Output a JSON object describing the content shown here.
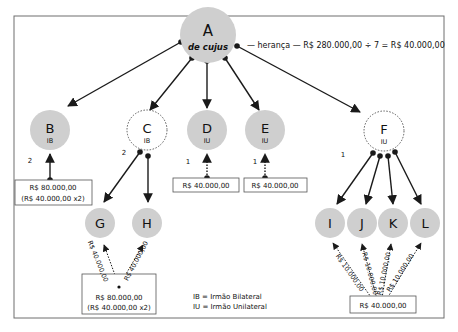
{
  "diagram": {
    "heritage_note": "— herança — R$ 280.000,00 ÷ 7 = R$ 40.000,00",
    "colors": {
      "node_fill": "#cfcfcf",
      "frame": "#6e6e6e",
      "line": "#1a1a1a"
    },
    "nodes": {
      "A": {
        "label": "A",
        "sub": "de cujus"
      },
      "B": {
        "label": "B",
        "sub": "IB",
        "weight": "2"
      },
      "C": {
        "label": "C",
        "sub": "IB",
        "weight": "2"
      },
      "D": {
        "label": "D",
        "sub": "IU",
        "weight": "1"
      },
      "E": {
        "label": "E",
        "sub": "IU",
        "weight": "1"
      },
      "F": {
        "label": "F",
        "sub": "IU",
        "weight": "1"
      },
      "G": {
        "label": "G"
      },
      "H": {
        "label": "H"
      },
      "I": {
        "label": "I"
      },
      "J": {
        "label": "J"
      },
      "K": {
        "label": "K"
      },
      "L": {
        "label": "L"
      }
    },
    "boxes": {
      "B": {
        "line1": "R$ 80.000,00",
        "line2": "(R$ 40.000,00 x2)"
      },
      "D": {
        "line1": "R$ 40.000,00"
      },
      "E": {
        "line1": "R$ 40.000,00"
      },
      "GH": {
        "line1": "R$ 80.000,00",
        "line2": "(R$ 40.000,00 x2)"
      },
      "IJKL": {
        "line1": "R$ 40.000,00"
      }
    },
    "edge_labels": {
      "G": "R$ 40.000,00",
      "H": "R$ 40.000,00",
      "I": "R$ 10.000,00",
      "J": "R$ 10.000,00",
      "K": "R$ 10.000,00",
      "L": "R$ 10.000,00"
    },
    "legend": {
      "ib": "IB = Irmão Bilateral",
      "iu": "IU = Irmão Unilateral"
    }
  }
}
